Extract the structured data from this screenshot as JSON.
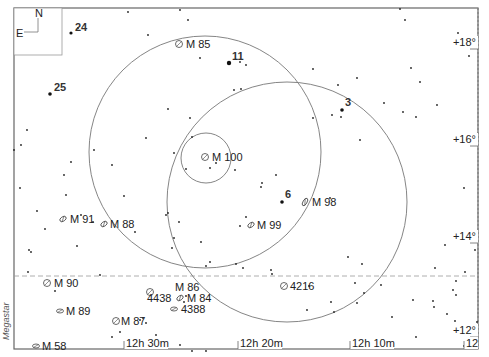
{
  "compass": {
    "north": "N",
    "east": "E"
  },
  "credit": "Megastar",
  "dec_labels": [
    {
      "text": "+18°",
      "y": 46
    },
    {
      "text": "+16°",
      "y": 143
    },
    {
      "text": "+14°",
      "y": 240
    },
    {
      "text": "+12°",
      "y": 334
    }
  ],
  "ra_labels": [
    {
      "text": "12h 30m",
      "x": 126
    },
    {
      "text": "12h 20m",
      "x": 240
    },
    {
      "text": "12h 10m",
      "x": 352
    },
    {
      "text": "12",
      "x": 466
    }
  ],
  "fov_circles": [
    {
      "name": "large-fov-circle-1",
      "cx": 205,
      "cy": 152,
      "r": 116
    },
    {
      "name": "large-fov-circle-2",
      "cx": 287,
      "cy": 202,
      "r": 120
    },
    {
      "name": "small-fov-circle",
      "cx": 206,
      "cy": 158,
      "r": 25
    }
  ],
  "dashed_line_y": 276,
  "star_labels": [
    {
      "text": "24",
      "x": 75,
      "y": 33,
      "sx": 71,
      "sy": 33,
      "r": 1.6
    },
    {
      "text": "25",
      "x": 54,
      "y": 93,
      "sx": 50,
      "sy": 94,
      "r": 1.8
    },
    {
      "text": "11",
      "x": 232,
      "y": 62,
      "sx": 229,
      "sy": 63,
      "r": 2.2
    },
    {
      "text": "3",
      "x": 345,
      "y": 108,
      "sx": 342,
      "sy": 110,
      "r": 1.8
    },
    {
      "text": "6",
      "x": 285,
      "y": 200,
      "sx": 282,
      "sy": 202,
      "r": 1.8
    }
  ],
  "galaxies": [
    {
      "label": "M 85",
      "x": 179,
      "y": 44,
      "tx": 186,
      "ty": 48,
      "shape": "round"
    },
    {
      "label": "M 100",
      "x": 205,
      "y": 157,
      "tx": 212,
      "ty": 161,
      "shape": "round"
    },
    {
      "label": "M 98",
      "x": 305,
      "y": 202,
      "tx": 312,
      "ty": 206,
      "shape": "edge"
    },
    {
      "label": "M 99",
      "x": 251,
      "y": 225,
      "tx": 257,
      "ty": 229,
      "shape": "oval"
    },
    {
      "label": "M 91",
      "x": 63,
      "y": 219,
      "tx": 70,
      "ty": 223,
      "shape": "oval"
    },
    {
      "label": "M 88",
      "x": 104,
      "y": 224,
      "tx": 110,
      "ty": 228,
      "shape": "oval"
    },
    {
      "label": "M 90",
      "x": 47,
      "y": 283,
      "tx": 54,
      "ty": 287,
      "shape": "round"
    },
    {
      "label": "M 89",
      "x": 60,
      "y": 311,
      "tx": 66,
      "ty": 315,
      "shape": "flat"
    },
    {
      "label": "M 87",
      "x": 116,
      "y": 321,
      "tx": 121,
      "ty": 325,
      "shape": "round"
    },
    {
      "label": "M 58",
      "x": 36,
      "y": 346,
      "tx": 42,
      "ty": 350,
      "shape": "flat"
    },
    {
      "label": "M 86",
      "x": 150,
      "y": 292,
      "tx": 175,
      "ty": 291,
      "shape": "round"
    },
    {
      "label": "4438",
      "x": 168,
      "y": 298,
      "tx": 147,
      "ty": 302,
      "shape": "none"
    },
    {
      "label": "M 84",
      "x": 180,
      "y": 298,
      "tx": 187,
      "ty": 302,
      "shape": "oval"
    },
    {
      "label": "4388",
      "x": 174,
      "y": 309,
      "tx": 181,
      "ty": 313,
      "shape": "flat"
    },
    {
      "label": "4216",
      "x": 284,
      "y": 286,
      "tx": 290,
      "ty": 290,
      "shape": "round"
    }
  ],
  "stars": [
    [
      78,
      28
    ],
    [
      128,
      12
    ],
    [
      180,
      10
    ],
    [
      188,
      20
    ],
    [
      148,
      35
    ],
    [
      200,
      58
    ],
    [
      240,
      62
    ],
    [
      246,
      65
    ],
    [
      234,
      90
    ],
    [
      241,
      89
    ],
    [
      168,
      109
    ],
    [
      190,
      118
    ],
    [
      146,
      138
    ],
    [
      192,
      137
    ],
    [
      174,
      153
    ],
    [
      216,
      163
    ],
    [
      210,
      168
    ],
    [
      186,
      169
    ],
    [
      235,
      170
    ],
    [
      276,
      175
    ],
    [
      262,
      183
    ],
    [
      261,
      187
    ],
    [
      282,
      202
    ],
    [
      246,
      217
    ],
    [
      240,
      226
    ],
    [
      330,
      198
    ],
    [
      342,
      110
    ],
    [
      332,
      115
    ],
    [
      341,
      117
    ],
    [
      313,
      118
    ],
    [
      357,
      78
    ],
    [
      384,
      103
    ],
    [
      313,
      69
    ],
    [
      338,
      85
    ],
    [
      360,
      140
    ],
    [
      411,
      68
    ],
    [
      416,
      117
    ],
    [
      403,
      112
    ],
    [
      420,
      82
    ],
    [
      458,
      33
    ],
    [
      456,
      42
    ],
    [
      469,
      56
    ],
    [
      437,
      105
    ],
    [
      464,
      188
    ],
    [
      400,
      9
    ],
    [
      405,
      20
    ],
    [
      21,
      145
    ],
    [
      64,
      175
    ],
    [
      71,
      162
    ],
    [
      94,
      150
    ],
    [
      81,
      215
    ],
    [
      93,
      222
    ],
    [
      124,
      196
    ],
    [
      135,
      232
    ],
    [
      27,
      130
    ],
    [
      29,
      250
    ],
    [
      31,
      252
    ],
    [
      55,
      291
    ],
    [
      45,
      229
    ],
    [
      37,
      211
    ],
    [
      20,
      188
    ],
    [
      77,
      246
    ],
    [
      168,
      213
    ],
    [
      166,
      215
    ],
    [
      179,
      222
    ],
    [
      174,
      238
    ],
    [
      172,
      248
    ],
    [
      201,
      242
    ],
    [
      210,
      262
    ],
    [
      236,
      264
    ],
    [
      243,
      268
    ],
    [
      271,
      270
    ],
    [
      272,
      274
    ],
    [
      348,
      257
    ],
    [
      362,
      264
    ],
    [
      355,
      283
    ],
    [
      381,
      285
    ],
    [
      334,
      312
    ],
    [
      357,
      303
    ],
    [
      392,
      317
    ],
    [
      447,
      314
    ],
    [
      453,
      290
    ],
    [
      433,
      301
    ],
    [
      455,
      321
    ],
    [
      477,
      322
    ],
    [
      462,
      335
    ],
    [
      416,
      337
    ],
    [
      464,
      346
    ],
    [
      120,
      332
    ],
    [
      137,
      342
    ],
    [
      140,
      320
    ],
    [
      146,
      323
    ],
    [
      156,
      335
    ],
    [
      162,
      342
    ],
    [
      180,
      345
    ],
    [
      192,
      351
    ],
    [
      206,
      351
    ],
    [
      186,
      296
    ],
    [
      184,
      302
    ],
    [
      309,
      286
    ],
    [
      364,
      293
    ],
    [
      434,
      307
    ],
    [
      456,
      295
    ],
    [
      456,
      281
    ],
    [
      435,
      268
    ],
    [
      307,
      310
    ],
    [
      331,
      302
    ],
    [
      413,
      300
    ],
    [
      475,
      250
    ],
    [
      445,
      245
    ],
    [
      465,
      272
    ],
    [
      112,
      337
    ],
    [
      14,
      150
    ],
    [
      112,
      165
    ],
    [
      66,
      195
    ],
    [
      28,
      272
    ],
    [
      100,
      275
    ],
    [
      143,
      318
    ],
    [
      206,
      266
    ]
  ]
}
